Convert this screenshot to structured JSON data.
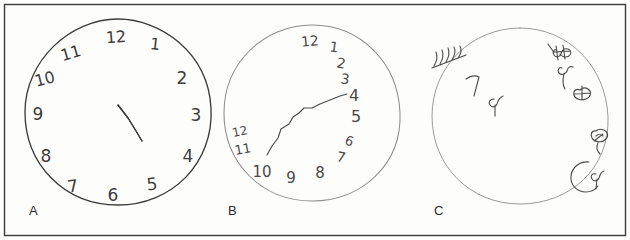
{
  "figure": {
    "type": "clock-drawing-test",
    "background_color": "#fdfdfc",
    "border_color": "#3a3a3a",
    "width": 630,
    "height": 240
  },
  "panels": [
    {
      "id": "A",
      "label": "A",
      "label_x": 29,
      "label_y": 203,
      "ink_color": "#3c3c3c",
      "circle": {
        "cx": 118,
        "cy": 112,
        "r": 93
      },
      "numbers": [
        {
          "text": "12",
          "x": 116,
          "y": 38,
          "rotate": -4,
          "size": 16
        },
        {
          "text": "1",
          "x": 155,
          "y": 45,
          "rotate": 6,
          "size": 16
        },
        {
          "text": "2",
          "x": 182,
          "y": 79,
          "rotate": 0,
          "size": 17
        },
        {
          "text": "3",
          "x": 196,
          "y": 116,
          "rotate": 0,
          "size": 17
        },
        {
          "text": "4",
          "x": 188,
          "y": 157,
          "rotate": 0,
          "size": 17
        },
        {
          "text": "5",
          "x": 152,
          "y": 185,
          "rotate": -6,
          "size": 17
        },
        {
          "text": "6",
          "x": 113,
          "y": 196,
          "rotate": 0,
          "size": 17
        },
        {
          "text": "7",
          "x": 73,
          "y": 187,
          "rotate": -8,
          "size": 17
        },
        {
          "text": "8",
          "x": 46,
          "y": 157,
          "rotate": 0,
          "size": 17
        },
        {
          "text": "9",
          "x": 38,
          "y": 115,
          "rotate": 0,
          "size": 17
        },
        {
          "text": "10",
          "x": 45,
          "y": 80,
          "rotate": -14,
          "size": 16
        },
        {
          "text": "11",
          "x": 71,
          "y": 54,
          "rotate": -16,
          "size": 16
        }
      ],
      "hands": [
        {
          "name": "long-hand-toward-2",
          "points": "118,105 137,97 150,93 164,85 173,80"
        },
        {
          "name": "short-hand-toward-4",
          "points": "118,105 128,118 136,131 142,141"
        }
      ],
      "notes": "intact clock: all 12 numerals correctly spaced, two hands from center"
    },
    {
      "id": "B",
      "label": "B",
      "label_x": 228,
      "label_y": 203,
      "ink_color": "#4a4a4a",
      "circle": {
        "cx": 312,
        "cy": 113,
        "r": 88
      },
      "numbers": [
        {
          "text": "12",
          "x": 310,
          "y": 42,
          "rotate": -5,
          "size": 14
        },
        {
          "text": "1",
          "x": 334,
          "y": 48,
          "rotate": 8,
          "size": 14
        },
        {
          "text": "2",
          "x": 341,
          "y": 64,
          "rotate": 10,
          "size": 14
        },
        {
          "text": "3",
          "x": 345,
          "y": 80,
          "rotate": 8,
          "size": 14
        },
        {
          "text": "4",
          "x": 354,
          "y": 96,
          "rotate": 0,
          "size": 16
        },
        {
          "text": "5",
          "x": 356,
          "y": 117,
          "rotate": 0,
          "size": 16
        },
        {
          "text": "6",
          "x": 349,
          "y": 142,
          "rotate": 18,
          "size": 13
        },
        {
          "text": "7",
          "x": 341,
          "y": 158,
          "rotate": 12,
          "size": 14
        },
        {
          "text": "8",
          "x": 320,
          "y": 173,
          "rotate": 0,
          "size": 15
        },
        {
          "text": "9",
          "x": 291,
          "y": 178,
          "rotate": 0,
          "size": 15
        },
        {
          "text": "10",
          "x": 262,
          "y": 172,
          "rotate": 0,
          "size": 15
        },
        {
          "text": "11",
          "x": 243,
          "y": 150,
          "rotate": -10,
          "size": 13
        },
        {
          "text": "12",
          "x": 240,
          "y": 132,
          "rotate": -12,
          "size": 12
        }
      ],
      "hands": [
        {
          "name": "wavy-hand",
          "points": "267,155 272,146 278,138 281,129 289,124 293,117 299,113 304,108 312,108 320,104 330,100 340,96 347,94"
        }
      ],
      "notes": "numbers crowded toward right side, duplicated 12, single irregular hand"
    },
    {
      "id": "C",
      "label": "C",
      "label_x": 434,
      "label_y": 203,
      "ink_color": "#4a4a4a",
      "circle": {
        "cx": 520,
        "cy": 116,
        "r": 88
      },
      "scribbles": [
        {
          "name": "left-tick-cluster",
          "x": 448,
          "y": 56
        },
        {
          "name": "seven-like-mark",
          "x": 472,
          "y": 86
        },
        {
          "name": "nine-like-mark",
          "x": 494,
          "y": 103
        },
        {
          "name": "upper-right-cluster",
          "x": 560,
          "y": 52
        },
        {
          "name": "right-loop-mark",
          "x": 566,
          "y": 72
        },
        {
          "name": "right-oval-mark",
          "x": 587,
          "y": 90
        },
        {
          "name": "lower-right-knot",
          "x": 600,
          "y": 137
        },
        {
          "name": "bottom-c-shape",
          "x": 588,
          "y": 172
        }
      ],
      "numbers": [],
      "hands": [],
      "notes": "severely degraded: no legible numerals or hands, marks clustered upper-left and along right edge"
    }
  ]
}
